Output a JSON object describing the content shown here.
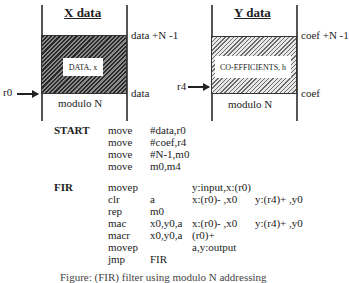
{
  "x_memory": {
    "title": "X data",
    "block_label": "DATA, x",
    "top_address": "data +N -1",
    "bottom_address": "data",
    "modulo_label": "modulo N",
    "pointer": "r0"
  },
  "y_memory": {
    "title": "Y data",
    "block_label": "CO-EFFICIENTS, h",
    "top_address": "coef +N -1",
    "bottom_address": "coef",
    "modulo_label": "modulo N",
    "pointer": "r4"
  },
  "code": {
    "start_label": "START",
    "start_lines": [
      {
        "op": "move",
        "arg": "#data,r0"
      },
      {
        "op": "move",
        "arg": "#coef,r4"
      },
      {
        "op": "move",
        "arg": "#N-1,m0"
      },
      {
        "op": "move",
        "arg": "m0,m4"
      }
    ],
    "fir_label": "FIR",
    "fir_lines": [
      {
        "op": "movep",
        "arg": "",
        "x": "y:input,x:(r0)",
        "y": ""
      },
      {
        "op": "clr",
        "arg": "a",
        "x": "x:(r0)- ,x0",
        "y": "y:(r4)+ ,y0"
      },
      {
        "op": "rep",
        "arg": "m0",
        "x": "",
        "y": ""
      },
      {
        "op": "mac",
        "arg": "x0,y0,a",
        "x": "x:(r0)- ,x0",
        "y": "y:(r4)+ ,y0"
      },
      {
        "op": "macr",
        "arg": "x0,y0,a",
        "x": "(r0)+",
        "y": ""
      },
      {
        "op": "movep",
        "arg": "",
        "x": "a,y:output",
        "y": ""
      },
      {
        "op": "jmp",
        "arg": "FIR",
        "x": "",
        "y": ""
      }
    ]
  },
  "caption": "Figure: (FIR) filter using modulo N addressing"
}
